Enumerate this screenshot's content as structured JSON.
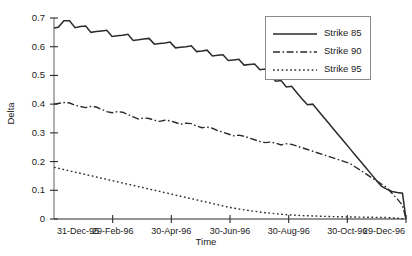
{
  "chart_data": {
    "type": "line",
    "title": "",
    "xlabel": "Time",
    "ylabel": "Delta",
    "grid": false,
    "legend_position": "upper right",
    "ylim": [
      0,
      0.7
    ],
    "ytick_labels": [
      "0.7",
      "0.6",
      "0.5",
      "0.4",
      "0.3",
      "0.2",
      "0.1",
      "0"
    ],
    "ytick_values": [
      0.7,
      0.6,
      0.5,
      0.4,
      0.3,
      0.2,
      0.1,
      0
    ],
    "categories": [
      "31-Dec-95",
      "29-Feb-96",
      "30-Apr-96",
      "30-Jun-96",
      "30-Aug-96",
      "30-Oct-96",
      "29-Dec-96"
    ],
    "xtick_labels": [
      "31-Dec-95",
      "29-Feb-96",
      "30-Apr-96",
      "30-Jun-96",
      "30-Aug-96",
      "30-Oct-96",
      "29-Dec-96"
    ],
    "xtick_positions": [
      0,
      0.1667,
      0.3333,
      0.5,
      0.6667,
      0.8333,
      1.0
    ],
    "series": [
      {
        "name": "Strike 85",
        "style": "solid",
        "color": "#2b2b2b",
        "x": [
          0.0,
          0.012,
          0.028,
          0.044,
          0.06,
          0.075,
          0.09,
          0.105,
          0.12,
          0.135,
          0.15,
          0.165,
          0.18,
          0.195,
          0.21,
          0.225,
          0.24,
          0.255,
          0.27,
          0.285,
          0.3,
          0.315,
          0.33,
          0.345,
          0.36,
          0.375,
          0.39,
          0.405,
          0.42,
          0.435,
          0.45,
          0.465,
          0.48,
          0.495,
          0.51,
          0.525,
          0.54,
          0.555,
          0.57,
          0.585,
          0.6,
          0.615,
          0.63,
          0.645,
          0.66,
          0.675,
          0.69,
          0.705,
          0.72,
          0.735,
          0.75,
          0.765,
          0.78,
          0.795,
          0.81,
          0.825,
          0.84,
          0.855,
          0.87,
          0.885,
          0.9,
          0.915,
          0.93,
          0.945,
          0.96,
          0.975,
          0.99,
          1.0
        ],
        "values": [
          0.665,
          0.668,
          0.69,
          0.69,
          0.666,
          0.67,
          0.672,
          0.65,
          0.653,
          0.655,
          0.657,
          0.636,
          0.638,
          0.64,
          0.643,
          0.622,
          0.624,
          0.627,
          0.629,
          0.609,
          0.611,
          0.613,
          0.616,
          0.596,
          0.598,
          0.6,
          0.603,
          0.583,
          0.585,
          0.588,
          0.568,
          0.57,
          0.572,
          0.552,
          0.554,
          0.556,
          0.536,
          0.538,
          0.54,
          0.52,
          0.522,
          0.5,
          0.48,
          0.482,
          0.46,
          0.462,
          0.44,
          0.418,
          0.398,
          0.4,
          0.378,
          0.356,
          0.334,
          0.312,
          0.29,
          0.268,
          0.246,
          0.224,
          0.202,
          0.18,
          0.158,
          0.136,
          0.114,
          0.104,
          0.096,
          0.092,
          0.09,
          0.0
        ]
      },
      {
        "name": "Strike 90",
        "style": "dashdot",
        "color": "#2b2b2b",
        "x": [
          0.0,
          0.015,
          0.03,
          0.045,
          0.06,
          0.075,
          0.09,
          0.105,
          0.12,
          0.135,
          0.15,
          0.165,
          0.18,
          0.195,
          0.21,
          0.225,
          0.24,
          0.255,
          0.27,
          0.285,
          0.3,
          0.315,
          0.33,
          0.345,
          0.36,
          0.375,
          0.39,
          0.405,
          0.42,
          0.435,
          0.45,
          0.465,
          0.48,
          0.495,
          0.51,
          0.525,
          0.54,
          0.555,
          0.57,
          0.585,
          0.6,
          0.615,
          0.63,
          0.645,
          0.66,
          0.675,
          0.69,
          0.705,
          0.72,
          0.735,
          0.75,
          0.765,
          0.78,
          0.795,
          0.81,
          0.825,
          0.84,
          0.855,
          0.87,
          0.885,
          0.9,
          0.915,
          0.93,
          0.945,
          0.96,
          0.975,
          0.99,
          1.0
        ],
        "values": [
          0.4,
          0.403,
          0.406,
          0.404,
          0.396,
          0.392,
          0.388,
          0.392,
          0.39,
          0.382,
          0.374,
          0.37,
          0.374,
          0.372,
          0.364,
          0.356,
          0.348,
          0.352,
          0.35,
          0.344,
          0.34,
          0.344,
          0.342,
          0.336,
          0.33,
          0.334,
          0.332,
          0.324,
          0.318,
          0.32,
          0.316,
          0.308,
          0.302,
          0.296,
          0.29,
          0.292,
          0.288,
          0.282,
          0.276,
          0.27,
          0.266,
          0.268,
          0.264,
          0.258,
          0.262,
          0.26,
          0.254,
          0.248,
          0.242,
          0.236,
          0.23,
          0.224,
          0.218,
          0.212,
          0.206,
          0.2,
          0.194,
          0.182,
          0.17,
          0.158,
          0.146,
          0.134,
          0.122,
          0.11,
          0.09,
          0.07,
          0.048,
          0.0
        ]
      },
      {
        "name": "Strike 95",
        "style": "dotted",
        "color": "#2b2b2b",
        "x": [
          0.0,
          0.05,
          0.1,
          0.15,
          0.2,
          0.25,
          0.3,
          0.35,
          0.4,
          0.45,
          0.5,
          0.55,
          0.6,
          0.65,
          0.7,
          0.75,
          0.8,
          0.85,
          0.9,
          0.95,
          1.0
        ],
        "values": [
          0.18,
          0.166,
          0.152,
          0.138,
          0.124,
          0.11,
          0.096,
          0.082,
          0.068,
          0.054,
          0.04,
          0.03,
          0.022,
          0.016,
          0.012,
          0.01,
          0.008,
          0.007,
          0.006,
          0.005,
          0.0
        ]
      }
    ]
  },
  "legend": {
    "entries": [
      {
        "label": "Strike 85",
        "style": "solid"
      },
      {
        "label": "Strike 90",
        "style": "dashdot"
      },
      {
        "label": "Strike 95",
        "style": "dotted"
      }
    ]
  }
}
